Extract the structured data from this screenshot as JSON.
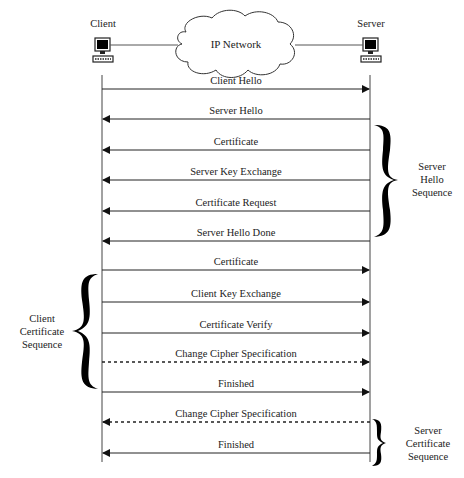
{
  "diagram": {
    "type": "sequence",
    "participants": [
      {
        "id": "client",
        "label": "Client",
        "icon": "computer-icon"
      },
      {
        "id": "server",
        "label": "Server",
        "icon": "computer-icon"
      }
    ],
    "network": {
      "label": "IP Network",
      "icon": "cloud-icon"
    },
    "messages": [
      {
        "label": "Client Hello",
        "from": "client",
        "to": "server",
        "style": "solid",
        "y": 89
      },
      {
        "label": "Server Hello",
        "from": "server",
        "to": "client",
        "style": "solid",
        "y": 119
      },
      {
        "label": "Certificate",
        "from": "server",
        "to": "client",
        "style": "solid",
        "y": 150
      },
      {
        "label": "Server Key Exchange",
        "from": "server",
        "to": "client",
        "style": "solid",
        "y": 180
      },
      {
        "label": "Certificate Request",
        "from": "server",
        "to": "client",
        "style": "solid",
        "y": 211
      },
      {
        "label": "Server Hello Done",
        "from": "server",
        "to": "client",
        "style": "solid",
        "y": 241
      },
      {
        "label": "Certificate",
        "from": "client",
        "to": "server",
        "style": "solid",
        "y": 270
      },
      {
        "label": "Client Key Exchange",
        "from": "client",
        "to": "server",
        "style": "solid",
        "y": 302
      },
      {
        "label": "Certificate Verify",
        "from": "client",
        "to": "server",
        "style": "solid",
        "y": 333
      },
      {
        "label": "Change Cipher Specification",
        "from": "client",
        "to": "server",
        "style": "dashed",
        "y": 362
      },
      {
        "label": "Finished",
        "from": "client",
        "to": "server",
        "style": "solid",
        "y": 392
      },
      {
        "label": "Change Cipher Specification",
        "from": "server",
        "to": "client",
        "style": "dashed",
        "y": 422
      },
      {
        "label": "Finished",
        "from": "server",
        "to": "client",
        "style": "solid",
        "y": 453
      }
    ],
    "groups": [
      {
        "lines": [
          "Server",
          "Hello",
          "Sequence"
        ],
        "side": "right"
      },
      {
        "lines": [
          "Client",
          "Certificate",
          "Sequence"
        ],
        "side": "left"
      },
      {
        "lines": [
          "Server",
          "Certificate",
          "Sequence"
        ],
        "side": "right"
      }
    ]
  }
}
